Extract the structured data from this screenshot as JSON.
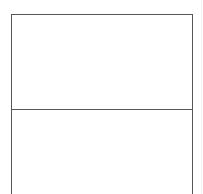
{
  "document": {
    "type": "blank-form-table",
    "background_color": "#ffffff",
    "border_color": "#555759",
    "table": {
      "rows": [
        {
          "name": "upper-cell",
          "text": ""
        },
        {
          "name": "lower-cell",
          "text": ""
        }
      ]
    }
  }
}
